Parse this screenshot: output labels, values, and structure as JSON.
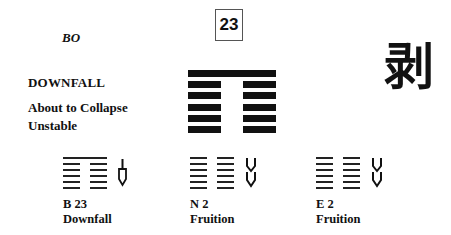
{
  "hexagram": {
    "number": "23",
    "romanized": "BO",
    "title": "DOWNFALL",
    "subtitles": [
      "About to Collapse",
      "Unstable"
    ],
    "character": "剥",
    "lines_top_to_bottom": [
      "solid",
      "broken",
      "broken",
      "broken",
      "broken",
      "broken"
    ]
  },
  "related": [
    {
      "code": "B 23",
      "name": "Downfall",
      "arrow": "single-down",
      "lines_top_to_bottom": [
        "solid",
        "broken",
        "broken",
        "broken",
        "broken",
        "broken"
      ]
    },
    {
      "code": "N 2",
      "name": "Fruition",
      "arrow": "double-down",
      "lines_top_to_bottom": [
        "broken",
        "broken",
        "broken",
        "broken",
        "broken",
        "broken"
      ]
    },
    {
      "code": "E 2",
      "name": "Fruition",
      "arrow": "double-down",
      "lines_top_to_bottom": [
        "broken",
        "broken",
        "broken",
        "broken",
        "broken",
        "broken"
      ]
    }
  ]
}
